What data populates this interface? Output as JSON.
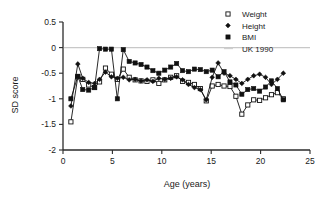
{
  "chart_data": {
    "type": "line",
    "title": "",
    "xlabel": "Age (years)",
    "ylabel": "SD score",
    "xlim": [
      0,
      25
    ],
    "ylim": [
      -2,
      0.5
    ],
    "xticks": [
      0,
      5,
      10,
      15,
      20,
      25
    ],
    "xtick_labels": [
      "0",
      "5",
      "10",
      "15",
      "20",
      "25"
    ],
    "yticks": [
      0.5,
      0,
      -0.5,
      -1,
      -1.5,
      -2
    ],
    "ytick_labels": [
      "0.5",
      "0",
      "-0.5",
      "-1",
      "-1.5",
      "-2"
    ],
    "grid": false,
    "legend_position": "top-right",
    "reference_lines": [
      {
        "name": "UK 1990",
        "y": 0,
        "color": "#c8c8c8"
      }
    ],
    "series": [
      {
        "name": "Weight",
        "marker": "open-square",
        "color": "#111111",
        "x": [
          0.8,
          1.5,
          2.0,
          2.6,
          3.2,
          3.7,
          4.3,
          4.9,
          5.5,
          6.1,
          6.7,
          7.3,
          7.9,
          8.5,
          9.1,
          9.7,
          10.3,
          10.9,
          11.5,
          12.1,
          12.7,
          13.3,
          13.9,
          14.5,
          15.1,
          15.7,
          16.3,
          16.9,
          17.5,
          18.1,
          18.7,
          19.3,
          19.9,
          20.5,
          21.1,
          21.7,
          22.3
        ],
        "y": [
          -1.45,
          -0.57,
          -0.62,
          -0.73,
          -0.78,
          -0.67,
          -0.4,
          -0.52,
          -0.62,
          -0.42,
          -0.58,
          -0.63,
          -0.65,
          -0.66,
          -0.63,
          -0.7,
          -0.63,
          -0.58,
          -0.55,
          -0.66,
          -0.68,
          -0.72,
          -0.8,
          -1.04,
          -0.75,
          -0.72,
          -0.75,
          -0.76,
          -0.95,
          -1.3,
          -1.12,
          -1.02,
          -1.03,
          -0.98,
          -0.92,
          -0.88,
          -1.0
        ]
      },
      {
        "name": "Height",
        "marker": "small-filled-diamond",
        "color": "#111111",
        "x": [
          0.8,
          1.5,
          2.0,
          2.6,
          3.2,
          3.7,
          4.3,
          4.9,
          5.5,
          6.1,
          6.7,
          7.3,
          7.9,
          8.5,
          9.1,
          9.7,
          10.3,
          10.9,
          11.5,
          12.1,
          12.7,
          13.3,
          13.9,
          14.5,
          15.1,
          15.7,
          16.3,
          16.9,
          17.5,
          18.1,
          18.7,
          19.3,
          19.9,
          20.5,
          21.1,
          21.7,
          22.3
        ],
        "y": [
          -1.14,
          -0.32,
          -0.6,
          -0.68,
          -0.7,
          -0.62,
          -0.48,
          -0.57,
          -0.6,
          -0.58,
          -0.63,
          -0.62,
          -0.65,
          -0.63,
          -0.66,
          -0.6,
          -0.62,
          -0.6,
          -0.57,
          -0.63,
          -0.72,
          -0.78,
          -0.82,
          -1.02,
          -0.58,
          -0.3,
          -0.5,
          -0.55,
          -0.62,
          -0.7,
          -0.62,
          -0.55,
          -0.52,
          -0.58,
          -0.72,
          -0.62,
          -0.5
        ]
      },
      {
        "name": "BMI",
        "marker": "filled-square",
        "color": "#111111",
        "x": [
          0.8,
          1.5,
          2.0,
          2.6,
          3.2,
          3.7,
          4.3,
          4.9,
          5.5,
          6.1,
          6.7,
          7.3,
          7.9,
          8.5,
          9.1,
          9.7,
          10.3,
          10.9,
          11.5,
          12.1,
          12.7,
          13.3,
          13.9,
          14.5,
          15.1,
          15.7,
          16.3,
          16.9,
          17.5,
          18.1,
          18.7,
          19.3,
          19.9,
          20.5,
          21.1,
          21.7,
          22.3
        ],
        "y": [
          -1.0,
          -0.56,
          -0.82,
          -0.83,
          -0.78,
          -0.02,
          -0.03,
          -0.03,
          -1.0,
          -0.04,
          -0.27,
          -0.3,
          -0.33,
          -0.38,
          -0.45,
          -0.5,
          -0.44,
          -0.38,
          -0.31,
          -0.45,
          -0.47,
          -0.42,
          -0.43,
          -0.47,
          -0.44,
          -0.57,
          -0.47,
          -0.67,
          -0.73,
          -0.91,
          -0.82,
          -0.8,
          -0.85,
          -0.77,
          -0.65,
          -0.8,
          -1.02
        ]
      }
    ]
  },
  "legend": {
    "items": [
      {
        "label": "Weight",
        "marker": "open-square"
      },
      {
        "label": "Height",
        "marker": "small-filled-diamond"
      },
      {
        "label": "BMI",
        "marker": "filled-square"
      },
      {
        "label": "UK 1990",
        "marker": "line"
      }
    ]
  }
}
